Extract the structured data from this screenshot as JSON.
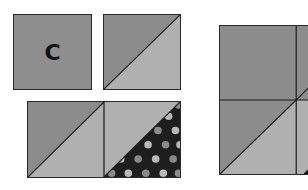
{
  "diagram": {
    "colors": {
      "dark_gray": "#8c8c8c",
      "light_gray": "#b0b0b0",
      "navy_black": "#1e1e1e",
      "dot_light": "#b9b9b9",
      "dot_mid": "#8a8a8a",
      "outline": "#2a2a2a"
    },
    "square_c": {
      "label": "C"
    }
  }
}
